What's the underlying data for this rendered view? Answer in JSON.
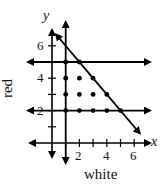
{
  "chart_data": {
    "type": "scatter",
    "title": "",
    "xlabel": "white",
    "ylabel": "red",
    "x_axis_letter": "x",
    "y_axis_letter": "y",
    "xlim": [
      0,
      6.5
    ],
    "ylim": [
      0,
      6.5
    ],
    "x_tick_labels": [
      "2",
      "4",
      "6"
    ],
    "y_tick_labels": [
      "2",
      "4",
      "6"
    ],
    "x_ticks": [
      1,
      2,
      3,
      4,
      5,
      6
    ],
    "y_ticks": [
      1,
      2,
      3,
      4,
      5,
      6
    ],
    "grid": false,
    "points": [
      {
        "x": 1,
        "y": 5
      },
      {
        "x": 2,
        "y": 5
      },
      {
        "x": 1,
        "y": 4
      },
      {
        "x": 2,
        "y": 4
      },
      {
        "x": 3,
        "y": 4
      },
      {
        "x": 1,
        "y": 3
      },
      {
        "x": 2,
        "y": 3
      },
      {
        "x": 3,
        "y": 3
      },
      {
        "x": 4,
        "y": 3
      },
      {
        "x": 1,
        "y": 2
      },
      {
        "x": 2,
        "y": 2
      },
      {
        "x": 3,
        "y": 2
      },
      {
        "x": 4,
        "y": 2
      },
      {
        "x": 5,
        "y": 2
      }
    ],
    "boundary_lines": [
      {
        "name": "x + y = 7",
        "type": "diagonal",
        "from": [
          0.3,
          6.7
        ],
        "to": [
          6.4,
          0.6
        ]
      },
      {
        "name": "y = 5",
        "type": "horizontal",
        "y": 5
      },
      {
        "name": "y = 2",
        "type": "horizontal",
        "y": 2
      },
      {
        "name": "x = 1",
        "type": "vertical",
        "x": 1
      }
    ]
  },
  "labels": {
    "x_axis_letter": "x",
    "y_axis_letter": "y",
    "xlabel": "white",
    "ylabel": "red",
    "xt2": "2",
    "xt4": "4",
    "xt6": "6",
    "yt2": "2",
    "yt4": "4",
    "yt6": "6"
  }
}
